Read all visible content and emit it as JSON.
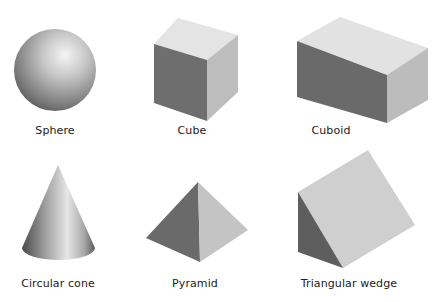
{
  "figure": {
    "shapes": [
      {
        "id": "sphere",
        "label": "Sphere"
      },
      {
        "id": "cube",
        "label": "Cube"
      },
      {
        "id": "cuboid",
        "label": "Cuboid"
      },
      {
        "id": "circular-cone",
        "label": "Circular cone"
      },
      {
        "id": "pyramid",
        "label": "Pyramid"
      },
      {
        "id": "triangular-wedge",
        "label": "Triangular wedge"
      }
    ],
    "colors": {
      "background": "#ffffff",
      "face_light": "#e2e2e2",
      "face_mid": "#bdbdbd",
      "face_dark": "#6a6a6a",
      "label_text": "#222222"
    }
  }
}
